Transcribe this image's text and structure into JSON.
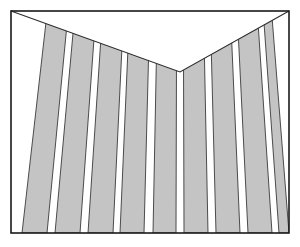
{
  "figure": {
    "title": "Chevron notch in a field of converging vertical stripes",
    "width": 300,
    "height": 247
  },
  "canvas": {
    "background_color": "#ffffff"
  },
  "frame": {
    "name": "outer-rectangle-border",
    "left": 11,
    "top": 11,
    "right": 289,
    "bottom": 233,
    "stroke_color": "#1a1a1a",
    "stroke_width": 1.6,
    "fill_color": "#ffffff"
  },
  "notch": {
    "name": "chevron-notch",
    "fill_color": "#ffffff",
    "stroke_color": "#2b2b2b",
    "stroke_width": 1.1,
    "apex": {
      "x": 180,
      "y": 72
    },
    "left_corner": {
      "x": 11,
      "y": 11
    },
    "right_corner": {
      "x": 289,
      "y": 11
    }
  },
  "stripes": {
    "name": "vertical-stripe-field",
    "fill_color": "#c4c4c4",
    "gap_color": "#ffffff",
    "stroke_color": "#3a3a3a",
    "stroke_width": 0.9,
    "count": 9,
    "apex_x": 180,
    "apex_y": 72,
    "convergence": 0.16,
    "bottom_y": 233,
    "bands": [
      {
        "index": 1,
        "bottom_left": 22,
        "bottom_right": 47
      },
      {
        "index": 2,
        "bottom_left": 55,
        "bottom_right": 80
      },
      {
        "index": 3,
        "bottom_left": 88,
        "bottom_right": 113
      },
      {
        "index": 4,
        "bottom_left": 120,
        "bottom_right": 144
      },
      {
        "index": 5,
        "bottom_left": 153,
        "bottom_right": 176
      },
      {
        "index": 6,
        "bottom_left": 184,
        "bottom_right": 208
      },
      {
        "index": 7,
        "bottom_left": 216,
        "bottom_right": 240
      },
      {
        "index": 8,
        "bottom_left": 248,
        "bottom_right": 272
      },
      {
        "index": 9,
        "bottom_left": 279,
        "bottom_right": 289
      }
    ]
  },
  "palette": {
    "stripe_gray": "#c4c4c4",
    "line_dark": "#2b2b2b",
    "frame_dark": "#1a1a1a",
    "paper_white": "#ffffff"
  }
}
